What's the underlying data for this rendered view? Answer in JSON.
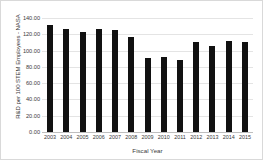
{
  "chart_data": {
    "type": "bar",
    "title": "",
    "xlabel": "Fiscal Year",
    "ylabel": "R&D per 100 STEM Employees - NASA",
    "categories": [
      "2003",
      "2004",
      "2005",
      "2006",
      "2007",
      "2008",
      "2009",
      "2010",
      "2011",
      "2012",
      "2013",
      "2014",
      "2015"
    ],
    "values": [
      131.5,
      126.0,
      123.0,
      127.0,
      125.5,
      117.0,
      90.5,
      92.5,
      89.0,
      110.5,
      105.5,
      112.0,
      110.0
    ],
    "ylim": [
      0,
      140
    ],
    "ytick_values": [
      140,
      120,
      100,
      80,
      60,
      40,
      20,
      0
    ],
    "ytick_labels": [
      "140.00",
      "120.00",
      "100.00",
      "80.00",
      "60.00",
      "40.00",
      "20.00",
      "0.00"
    ],
    "grid": true,
    "legend": false,
    "bar_color": "#111111",
    "grid_color": "#e4e4e4",
    "axis_color": "#bfbfbf",
    "text_color": "#3a3a3a",
    "background": "#ffffff"
  }
}
